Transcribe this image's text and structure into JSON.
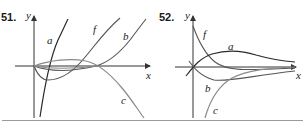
{
  "figures": [
    {
      "number": "51.",
      "axis_labels": {
        "x": "x",
        "y": "y"
      },
      "curves": [
        {
          "label": "a",
          "description": "steep increasing curve crossing origin region from bottom to top",
          "color": "#2a2a2a"
        },
        {
          "label": "f",
          "description": "cubic-like curve dipping below axis then rising",
          "color": "#555555"
        },
        {
          "label": "b",
          "description": "curve staying near axis then rising on right",
          "color": "#555555"
        },
        {
          "label": "c",
          "description": "curve slightly above axis then falling on right",
          "color": "#8a8a8a"
        }
      ]
    },
    {
      "number": "52.",
      "axis_labels": {
        "x": "x",
        "y": "y"
      },
      "curves": [
        {
          "label": "f",
          "description": "decreasing curve from top approaching axis",
          "color": "#555555"
        },
        {
          "label": "a",
          "description": "hump rising from origin then decaying toward axis",
          "color": "#2a2a2a"
        },
        {
          "label": "b",
          "description": "curve dipping below axis then returning toward axis",
          "color": "#555555"
        },
        {
          "label": "c",
          "description": "curve rising from bottom approaching axis",
          "color": "#8a8a8a"
        }
      ]
    }
  ]
}
